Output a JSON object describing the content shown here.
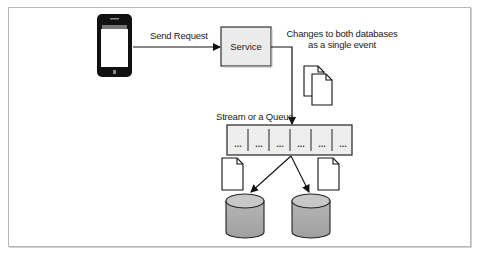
{
  "diagram": {
    "nodes": {
      "phone": {
        "name": "mobile-phone"
      },
      "service": {
        "label": "Service"
      },
      "queue": {
        "label": "Stream or a Queue",
        "cells": [
          "...",
          "...",
          "...",
          "...",
          "...",
          "..."
        ]
      },
      "database_1": {
        "name": "database"
      },
      "database_2": {
        "name": "database"
      }
    },
    "edges": {
      "send_request": {
        "label": "Send Request"
      },
      "event": {
        "label_line1": "Changes to both databases",
        "label_line2": "as a single event"
      }
    },
    "colors": {
      "frame_border": "#b8b8b8",
      "service_fill": "#ebebeb",
      "queue_fill": "#eeeeee",
      "db_top": "#c8c8c8",
      "db_body": "#a9a9a9",
      "phone": "#111111"
    }
  }
}
